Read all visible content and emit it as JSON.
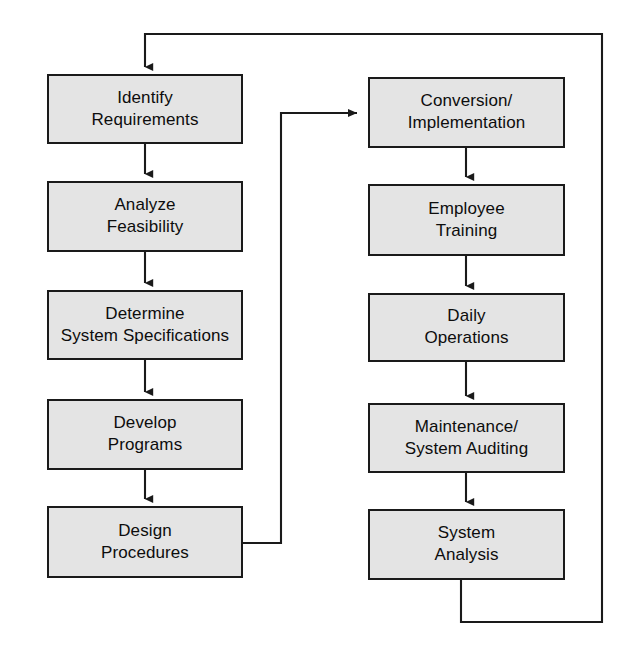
{
  "diagram": {
    "type": "flowchart",
    "colors": {
      "box_fill": "#e4e4e4",
      "box_border": "#1a1a1a",
      "connector": "#1a1a1a",
      "background": "#ffffff",
      "text": "#0d0d0d"
    },
    "nodes": [
      {
        "id": "identify-requirements",
        "line1": "Identify",
        "line2": "Requirements",
        "column": "left",
        "order": 1,
        "x": 47,
        "y": 74,
        "w": 196,
        "h": 70
      },
      {
        "id": "analyze-feasibility",
        "line1": "Analyze",
        "line2": "Feasibility",
        "column": "left",
        "order": 2,
        "x": 47,
        "y": 181,
        "w": 196,
        "h": 71
      },
      {
        "id": "determine-system-specifications",
        "line1": "Determine",
        "line2": "System Specifications",
        "column": "left",
        "order": 3,
        "x": 47,
        "y": 290,
        "w": 196,
        "h": 70
      },
      {
        "id": "develop-programs",
        "line1": "Develop",
        "line2": "Programs",
        "column": "left",
        "order": 4,
        "x": 47,
        "y": 399,
        "w": 196,
        "h": 71
      },
      {
        "id": "design-procedures",
        "line1": "Design",
        "line2": "Procedures",
        "column": "left",
        "order": 5,
        "x": 47,
        "y": 506,
        "w": 196,
        "h": 72
      },
      {
        "id": "conversion-implementation",
        "line1": "Conversion/",
        "line2": "Implementation",
        "column": "right",
        "order": 6,
        "x": 368,
        "y": 77,
        "w": 197,
        "h": 71
      },
      {
        "id": "employee-training",
        "line1": "Employee",
        "line2": "Training",
        "column": "right",
        "order": 7,
        "x": 368,
        "y": 184,
        "w": 197,
        "h": 72
      },
      {
        "id": "daily-operations",
        "line1": "Daily",
        "line2": "Operations",
        "column": "right",
        "order": 8,
        "x": 368,
        "y": 293,
        "w": 197,
        "h": 69
      },
      {
        "id": "maintenance-system-auditing",
        "line1": "Maintenance/",
        "line2": "System Auditing",
        "column": "right",
        "order": 9,
        "x": 368,
        "y": 403,
        "w": 197,
        "h": 70
      },
      {
        "id": "system-analysis",
        "line1": "System",
        "line2": "Analysis",
        "column": "right",
        "order": 10,
        "x": 368,
        "y": 509,
        "w": 197,
        "h": 71
      }
    ],
    "connectors": [
      {
        "id": "identify-to-analyze",
        "from": "identify-requirements",
        "to": "analyze-feasibility",
        "kind": "vertical-arrow",
        "path": "M145,144 L145,179",
        "arrow_at": [
          145,
          181
        ]
      },
      {
        "id": "analyze-to-determine",
        "from": "analyze-feasibility",
        "to": "determine-system-specifications",
        "kind": "vertical-arrow",
        "path": "M145,252 L145,288",
        "arrow_at": [
          145,
          290
        ]
      },
      {
        "id": "determine-to-develop",
        "from": "determine-system-specifications",
        "to": "develop-programs",
        "kind": "vertical-arrow",
        "path": "M145,360 L145,397",
        "arrow_at": [
          145,
          399
        ]
      },
      {
        "id": "develop-to-design",
        "from": "develop-programs",
        "to": "design-procedures",
        "kind": "vertical-arrow",
        "path": "M145,470 L145,504",
        "arrow_at": [
          145,
          506
        ]
      },
      {
        "id": "design-to-conversion",
        "from": "design-procedures",
        "to": "conversion-implementation",
        "kind": "elbow-arrow",
        "path": "M243,543 L281,543 L281,113 L363,113",
        "arrow_at": [
          368,
          113
        ]
      },
      {
        "id": "conversion-to-training",
        "from": "conversion-implementation",
        "to": "employee-training",
        "kind": "vertical-arrow",
        "path": "M466,148 L466,182",
        "arrow_at": [
          466,
          184
        ]
      },
      {
        "id": "training-to-operations",
        "from": "employee-training",
        "to": "daily-operations",
        "kind": "vertical-arrow",
        "path": "M466,256 L466,291",
        "arrow_at": [
          466,
          293
        ]
      },
      {
        "id": "operations-to-maintenance",
        "from": "daily-operations",
        "to": "maintenance-system-auditing",
        "kind": "vertical-arrow",
        "path": "M466,362 L466,401",
        "arrow_at": [
          466,
          403
        ]
      },
      {
        "id": "maintenance-to-analysis",
        "from": "maintenance-system-auditing",
        "to": "system-analysis",
        "kind": "vertical-arrow",
        "path": "M466,473 L466,507",
        "arrow_at": [
          466,
          509
        ]
      },
      {
        "id": "analysis-feedback-to-identify",
        "from": "system-analysis",
        "to": "identify-requirements",
        "kind": "feedback-loop-arrow",
        "path": "M461,580 L461,622 L602,622 L602,34 L145,34 L145,70",
        "arrow_at": [
          145,
          74
        ]
      }
    ]
  }
}
